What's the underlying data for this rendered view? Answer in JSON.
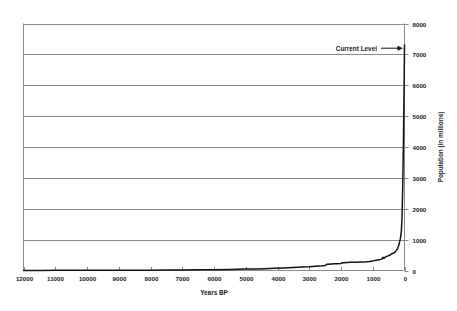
{
  "chart_data": {
    "type": "line",
    "title": "",
    "xlabel": "Years BP",
    "ylabel": "Population (in millions)",
    "xlim": [
      12000,
      0
    ],
    "ylim": [
      0,
      8000
    ],
    "x_reversed": true,
    "grid": "horizontal",
    "legend": "none",
    "y_axis_position": "right",
    "xticks": [
      12000,
      11000,
      10000,
      9000,
      8000,
      7000,
      6000,
      5000,
      4000,
      3000,
      2000,
      1000,
      0
    ],
    "xtick_labels": [
      "12000",
      "11000",
      "10000",
      "9000",
      "8000",
      "7000",
      "6000",
      "5000",
      "4000",
      "3000",
      "2000",
      "1000",
      "0"
    ],
    "yticks": [
      0,
      1000,
      2000,
      3000,
      4000,
      5000,
      6000,
      7000,
      8000
    ],
    "ytick_labels": [
      "0",
      "1000",
      "2000",
      "3000",
      "4000",
      "5000",
      "6000",
      "7000",
      "8000"
    ],
    "series": [
      {
        "name": "World population",
        "color": "#111111",
        "x": [
          12000,
          11500,
          11000,
          10500,
          10000,
          9500,
          9000,
          8500,
          8000,
          7500,
          7000,
          6500,
          6000,
          5500,
          5000,
          4700,
          4400,
          4100,
          3800,
          3500,
          3200,
          3000,
          2800,
          2600,
          2500,
          2450,
          2400,
          2300,
          2200,
          2100,
          2000,
          1950,
          1900,
          1800,
          1700,
          1600,
          1500,
          1400,
          1300,
          1200,
          1100,
          1050,
          1000,
          950,
          900,
          850,
          800,
          750,
          700,
          680,
          660,
          640,
          620,
          600,
          580,
          550,
          520,
          500,
          470,
          440,
          400,
          360,
          320,
          280,
          250,
          220,
          200,
          180,
          160,
          140,
          120,
          100,
          80,
          60,
          50,
          40,
          30,
          20,
          10,
          0
        ],
        "y": [
          4,
          4,
          5,
          5,
          5,
          6,
          7,
          8,
          10,
          13,
          17,
          22,
          28,
          35,
          45,
          52,
          60,
          70,
          82,
          95,
          110,
          120,
          135,
          150,
          160,
          200,
          205,
          210,
          215,
          222,
          230,
          250,
          255,
          260,
          265,
          268,
          270,
          272,
          275,
          280,
          290,
          300,
          310,
          320,
          330,
          340,
          350,
          360,
          380,
          430,
          400,
          395,
          420,
          440,
          450,
          460,
          470,
          480,
          495,
          510,
          545,
          560,
          580,
          620,
          660,
          700,
          760,
          820,
          900,
          990,
          1100,
          1260,
          1650,
          2520,
          3020,
          3700,
          4430,
          5320,
          6140,
          7300
        ],
        "annotations": [
          {
            "text": "Current Level",
            "points_to_x": 0,
            "points_to_y": 7200
          }
        ]
      }
    ]
  },
  "axes": {
    "x_title": "Years BP",
    "y_title": "Population (in millions)"
  },
  "annotation": {
    "label": "Current Level"
  },
  "colors": {
    "curve": "#111111",
    "gridline": "#8a8a8a",
    "axis": "#8a8a8a",
    "text": "#1a1a1a",
    "background": "#ffffff"
  }
}
